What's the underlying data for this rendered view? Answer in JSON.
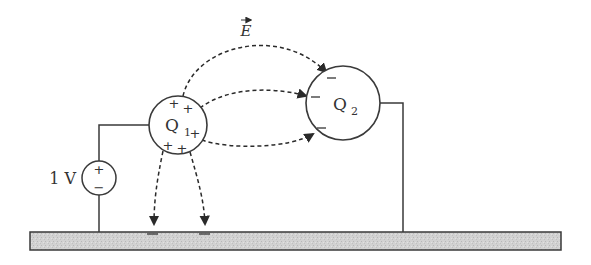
{
  "diagram": {
    "type": "electrostatics-circuit",
    "colors": {
      "stroke": "#3a3a3a",
      "ground_fill": "#cfcfcf",
      "background": "#ffffff"
    },
    "field_label": "E",
    "source": {
      "label": "1 V",
      "plus": "+",
      "minus": "−"
    },
    "conductor1": {
      "label": "Q",
      "subscript": "1",
      "charge_sign": "+"
    },
    "conductor2": {
      "label": "Q",
      "subscript": "2",
      "charge_sign": "−"
    },
    "ground": {
      "induced_charge_sign": "−"
    }
  }
}
